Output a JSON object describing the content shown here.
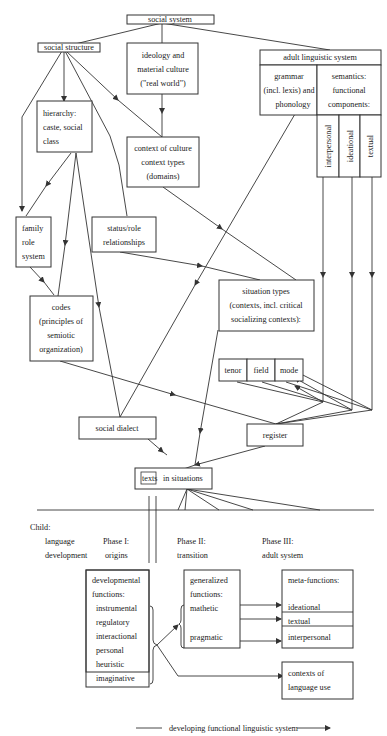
{
  "diagram": {
    "nodes": {
      "social_system": "social system",
      "social_structure": "social structure",
      "ideology": [
        "ideology and",
        "material culture",
        "(\"real world\")"
      ],
      "adult_linguistic_system": {
        "title": "adult linguistic system",
        "grammar": [
          "grammar",
          "(incl. lexis) and",
          "phonology"
        ],
        "semantics": [
          "semantics:",
          "functional",
          "components:"
        ],
        "components": [
          "interpersonal",
          "ideational",
          "textual"
        ]
      },
      "hierarchy": [
        "hierarchy:",
        "caste, social",
        "class"
      ],
      "context_of_culture": [
        "context of culture",
        "context types",
        "(domains)"
      ],
      "family_role_system": [
        "family",
        "role",
        "system"
      ],
      "status_role": [
        "status/role",
        "relationships"
      ],
      "situation_types": [
        "situation types",
        "(contexts, incl. critical",
        "socializing contexts):"
      ],
      "codes": [
        "codes",
        "(principles of",
        "semiotic",
        "organization)"
      ],
      "tenor": "tenor",
      "field": "field",
      "mode": "mode",
      "social_dialect": "social dialect",
      "register": "register",
      "texts": "texts",
      "in_situations": "in situations"
    },
    "lower": {
      "child_label": "Child:",
      "language_development": [
        "language",
        "development"
      ],
      "phase1": [
        "Phase I:",
        "origins"
      ],
      "phase2": [
        "Phase II:",
        "transition"
      ],
      "phase3": [
        "Phase III:",
        "adult system"
      ],
      "developmental_functions": {
        "title": [
          "developmental",
          "functions:"
        ],
        "items": [
          "instrumental",
          "regulatory",
          "interactional",
          "personal",
          "heuristic",
          "imaginative"
        ]
      },
      "generalized_functions": {
        "title": [
          "generalized",
          "functions:"
        ],
        "items": [
          "mathetic",
          "pragmatic"
        ]
      },
      "meta_functions": {
        "title": "meta-functions:",
        "items": [
          "ideational",
          "textual",
          "interpersonal"
        ]
      },
      "contexts_of_language_use": [
        "contexts of",
        "language use"
      ],
      "footer": "developing functional linguistic system"
    },
    "colors": {
      "line": "#333333",
      "text": "#222222",
      "background": "#ffffff"
    }
  }
}
